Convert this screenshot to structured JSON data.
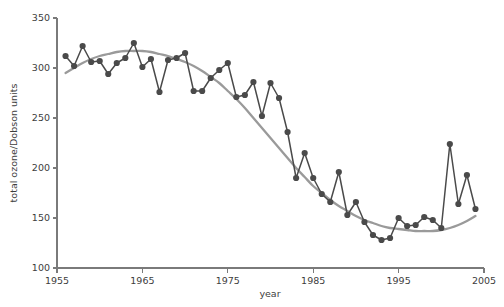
{
  "chart_data": {
    "type": "line",
    "title": "",
    "subtitle": "",
    "xlabel": "year",
    "ylabel": "total ozone/Dobson units",
    "xlim": [
      1955,
      2005
    ],
    "ylim": [
      100,
      350
    ],
    "xticks": [
      1955,
      1965,
      1975,
      1985,
      1995,
      2005
    ],
    "xtick_labels": [
      "1955",
      "1965",
      "1975",
      "1985",
      "1995",
      "2005"
    ],
    "yticks": [
      100,
      150,
      200,
      250,
      300,
      350
    ],
    "ytick_labels": [
      "100",
      "150",
      "200",
      "250",
      "300",
      "350"
    ],
    "grid": false,
    "legend": null,
    "legend_position": "none",
    "colors": {
      "series_line": "#4a4a4a",
      "marker": "#4a4a4a",
      "trend": "#9a9a9a",
      "axis": "#7a7a7a",
      "text": "#3d3d3d",
      "background": "#ffffff"
    },
    "x": [
      1956,
      1957,
      1958,
      1959,
      1960,
      1961,
      1962,
      1963,
      1964,
      1965,
      1966,
      1967,
      1968,
      1969,
      1970,
      1971,
      1972,
      1973,
      1974,
      1975,
      1976,
      1977,
      1978,
      1979,
      1980,
      1981,
      1982,
      1983,
      1984,
      1985,
      1986,
      1987,
      1988,
      1989,
      1990,
      1991,
      1992,
      1993,
      1994,
      1995,
      1996,
      1997,
      1998,
      1999,
      2000,
      2001,
      2002,
      2003,
      2004
    ],
    "series": [
      {
        "name": "total ozone",
        "marker": "circle",
        "values": [
          312,
          302,
          322,
          306,
          307,
          294,
          305,
          310,
          325,
          301,
          309,
          276,
          308,
          310,
          315,
          277,
          277,
          290,
          298,
          305,
          271,
          273,
          286,
          252,
          285,
          270,
          236,
          190,
          215,
          190,
          174,
          166,
          196,
          153,
          166,
          146,
          133,
          128,
          130,
          150,
          142,
          143,
          151,
          148,
          140,
          224,
          164,
          193,
          159
        ]
      },
      {
        "name": "smoothed trend",
        "marker": "none",
        "values": [
          295,
          300,
          305,
          309,
          312,
          314,
          316,
          317,
          317,
          317,
          316,
          314,
          312,
          309,
          306,
          302,
          297,
          291,
          285,
          277,
          269,
          260,
          250,
          240,
          230,
          220,
          210,
          200,
          191,
          182,
          175,
          168,
          162,
          157,
          152,
          148,
          145,
          142,
          140,
          139,
          138,
          137,
          137,
          137,
          138,
          140,
          143,
          147,
          152
        ]
      }
    ]
  }
}
